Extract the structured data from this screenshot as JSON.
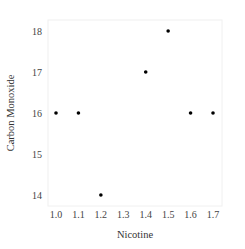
{
  "chart_data": {
    "type": "scatter",
    "title": "",
    "xlabel": "Nicotine",
    "ylabel": "Carbon Monoxide",
    "x": [
      1.0,
      1.1,
      1.2,
      1.4,
      1.5,
      1.6,
      1.7
    ],
    "y": [
      16,
      16,
      14,
      17,
      18,
      16,
      16
    ],
    "xlim": [
      0.95,
      1.75
    ],
    "ylim": [
      13.75,
      18.25
    ],
    "xticks": [
      "1.0",
      "1.1",
      "1.2",
      "1.3",
      "1.4",
      "1.5",
      "1.6",
      "1.7"
    ],
    "yticks": [
      "14",
      "15",
      "16",
      "17",
      "18"
    ],
    "grid": false,
    "legend": null,
    "point_color": "#000000"
  }
}
